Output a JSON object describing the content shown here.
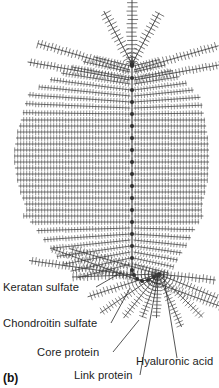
{
  "figure": {
    "caption": "(b)",
    "background_color": "#ffffff",
    "ink_color": "#3a3a3a",
    "node_color": "#2e2e2e",
    "text_color": "#1d1d1d"
  },
  "labels": [
    {
      "id": "keratan-sulfate",
      "text": "Keratan sulfate",
      "x": 3,
      "y": 291,
      "leader": "M 96,287 L 122,272"
    },
    {
      "id": "chondroitin-sulfate",
      "text": "Chondroitin sulfate",
      "x": 3,
      "y": 327,
      "leader": "M 111,323 L 130,288"
    },
    {
      "id": "core-protein",
      "text": "Core protein",
      "x": 37,
      "y": 356,
      "leader": "M 113,352 L 139,320"
    },
    {
      "id": "link-protein",
      "text": "Link protein",
      "x": 74,
      "y": 379,
      "leader": "M 140,375 L 158,276"
    },
    {
      "id": "hyaluronic-acid",
      "text": "Hyaluronic acid",
      "x": 136,
      "y": 365,
      "leader": "M 177,358 L 163,272"
    }
  ],
  "structure": {
    "backbone_label": "hyaluronic-acid-backbone",
    "backbone_x": 132,
    "backbone_top": 62,
    "backbone_bottom": 272,
    "link_protein_count": 22,
    "core_protein_count": 34,
    "side_chain_types": [
      "keratan sulfate",
      "chondroitin sulfate"
    ]
  },
  "chart_data": {
    "type": "diagram",
    "elements": [
      "hyaluronic acid backbone",
      "link proteins",
      "core proteins",
      "keratan sulfate chains",
      "chondroitin sulfate chains"
    ]
  }
}
